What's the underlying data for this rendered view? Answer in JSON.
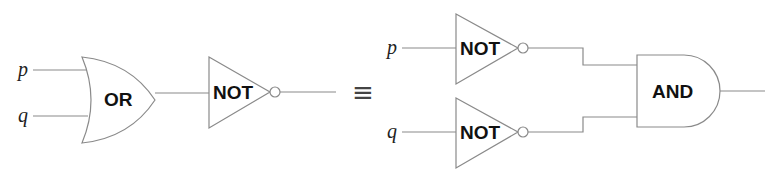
{
  "diagram": {
    "type": "logic-gate-equivalence",
    "left_circuit": {
      "inputs": [
        "p",
        "q"
      ],
      "gates": [
        {
          "id": "or1",
          "type": "OR",
          "label": "OR"
        },
        {
          "id": "not1",
          "type": "NOT",
          "label": "NOT"
        }
      ]
    },
    "equivalence_symbol": "≡",
    "right_circuit": {
      "inputs": [
        "p",
        "q"
      ],
      "gates": [
        {
          "id": "not_p",
          "type": "NOT",
          "label": "NOT"
        },
        {
          "id": "not_q",
          "type": "NOT",
          "label": "NOT"
        },
        {
          "id": "and1",
          "type": "AND",
          "label": "AND"
        }
      ]
    },
    "colors": {
      "line": "#8a8a8a",
      "text": "#111111",
      "background": "#ffffff"
    }
  }
}
